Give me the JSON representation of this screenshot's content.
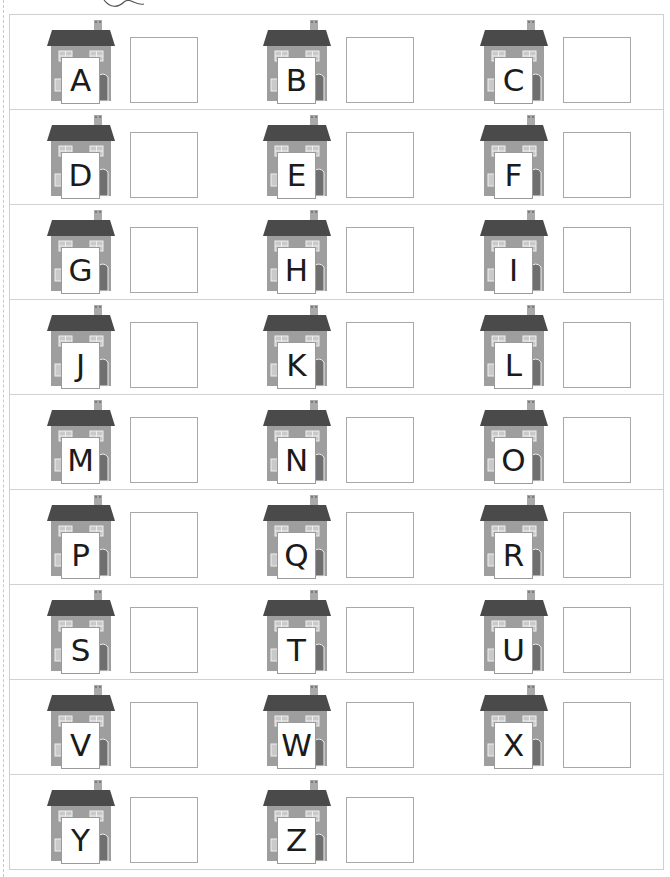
{
  "worksheet": {
    "colors": {
      "roof": "#4a4a4a",
      "wall": "#9e9e9e",
      "chimney": "#a9a9a9",
      "window": "#d8d8d8",
      "door": "#6f6f6f",
      "border": "#cfcfcf",
      "answer_box_border": "#a8a8a8"
    },
    "rows": [
      {
        "cells": [
          {
            "letter": "A",
            "icon": "house-icon"
          },
          {
            "letter": "B",
            "icon": "house-icon"
          },
          {
            "letter": "C",
            "icon": "house-icon"
          }
        ]
      },
      {
        "cells": [
          {
            "letter": "D",
            "icon": "house-icon"
          },
          {
            "letter": "E",
            "icon": "house-icon"
          },
          {
            "letter": "F",
            "icon": "house-icon"
          }
        ]
      },
      {
        "cells": [
          {
            "letter": "G",
            "icon": "house-icon"
          },
          {
            "letter": "H",
            "icon": "house-icon"
          },
          {
            "letter": "I",
            "icon": "house-icon"
          }
        ]
      },
      {
        "cells": [
          {
            "letter": "J",
            "icon": "house-icon"
          },
          {
            "letter": "K",
            "icon": "house-icon"
          },
          {
            "letter": "L",
            "icon": "house-icon"
          }
        ]
      },
      {
        "cells": [
          {
            "letter": "M",
            "icon": "house-icon"
          },
          {
            "letter": "N",
            "icon": "house-icon"
          },
          {
            "letter": "O",
            "icon": "house-icon"
          }
        ]
      },
      {
        "cells": [
          {
            "letter": "P",
            "icon": "house-icon"
          },
          {
            "letter": "Q",
            "icon": "house-icon"
          },
          {
            "letter": "R",
            "icon": "house-icon"
          }
        ]
      },
      {
        "cells": [
          {
            "letter": "S",
            "icon": "house-icon"
          },
          {
            "letter": "T",
            "icon": "house-icon"
          },
          {
            "letter": "U",
            "icon": "house-icon"
          }
        ]
      },
      {
        "cells": [
          {
            "letter": "V",
            "icon": "house-icon"
          },
          {
            "letter": "W",
            "icon": "house-icon"
          },
          {
            "letter": "X",
            "icon": "house-icon"
          }
        ]
      },
      {
        "cells": [
          {
            "letter": "Y",
            "icon": "house-icon"
          },
          {
            "letter": "Z",
            "icon": "house-icon"
          }
        ]
      }
    ]
  }
}
